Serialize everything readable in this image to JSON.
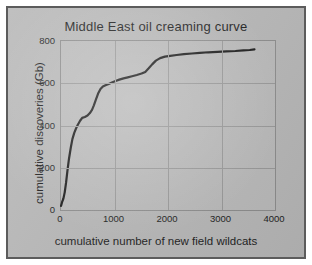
{
  "chart_data": {
    "type": "line",
    "title": "Middle East oil creaming curve",
    "xlabel": "cumulative number of new field wildcats",
    "ylabel": "cumulative discoveries (Gb)",
    "xlim": [
      0,
      4000
    ],
    "ylim": [
      0,
      800
    ],
    "xticks": [
      0,
      1000,
      2000,
      3000,
      4000
    ],
    "yticks": [
      0,
      200,
      400,
      600,
      800
    ],
    "xtick_labels": [
      "0",
      "1000",
      "2000",
      "3000",
      "4000"
    ],
    "ytick_labels": [
      "0",
      "200",
      "400",
      "600",
      "800"
    ],
    "grid": true,
    "legend": null,
    "line_color": "#1a1a1a",
    "series": [
      {
        "name": "cumulative discoveries",
        "x": [
          0,
          20,
          45,
          70,
          95,
          120,
          150,
          185,
          215,
          250,
          285,
          320,
          360,
          400,
          450,
          500,
          545,
          585,
          620,
          660,
          700,
          745,
          790,
          840,
          900,
          960,
          1030,
          1100,
          1180,
          1260,
          1340,
          1430,
          1520,
          1590,
          1650,
          1720,
          1790,
          1870,
          1960,
          2060,
          2180,
          2320,
          2470,
          2620,
          2780,
          2950,
          3120,
          3290,
          3440,
          3560,
          3650
        ],
        "y": [
          10,
          28,
          45,
          75,
          120,
          175,
          235,
          290,
          330,
          360,
          382,
          400,
          418,
          432,
          436,
          443,
          455,
          470,
          492,
          520,
          548,
          570,
          582,
          588,
          594,
          601,
          608,
          615,
          621,
          626,
          631,
          637,
          644,
          652,
          668,
          688,
          706,
          718,
          725,
          729,
          733,
          737,
          740,
          743,
          746,
          748,
          750,
          752,
          755,
          757,
          760
        ]
      }
    ]
  },
  "figure": {
    "title_lead": "M",
    "title_rest_1": "iddle ",
    "title_cap_2": "E",
    "title_rest_2": "ast oil creaming curve"
  }
}
